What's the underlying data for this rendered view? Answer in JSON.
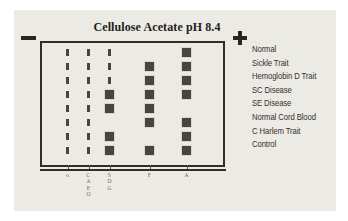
{
  "figure": {
    "title": "Cellulose Acetate pH 8.4",
    "cathode_marker": "−",
    "anode_marker": "+"
  },
  "chart_data": {
    "type": "heatmap",
    "title": "Cellulose Acetate pH 8.4",
    "xlabel": "",
    "ylabel": "",
    "categories": [
      "origin",
      "C\nA2\nE\nO",
      "S\nD\nG",
      "F",
      "A"
    ],
    "column_labels": [
      {
        "id": "origin",
        "lines": [
          "o"
        ]
      },
      {
        "id": "ca2eo",
        "lines": [
          "C",
          "A",
          "E",
          "O"
        ]
      },
      {
        "id": "sdg",
        "lines": [
          "S",
          "D",
          "G"
        ]
      },
      {
        "id": "f",
        "lines": [
          "F"
        ]
      },
      {
        "id": "a",
        "lines": [
          "A"
        ]
      }
    ],
    "rows": [
      {
        "label": "Normal",
        "bands": [
          "tick",
          "tick",
          "tick",
          "none",
          "band"
        ]
      },
      {
        "label": "Sickle Trait",
        "bands": [
          "tick",
          "tick",
          "tick",
          "band",
          "band"
        ]
      },
      {
        "label": "Hemoglobin D Trait",
        "bands": [
          "tick",
          "tick",
          "tick",
          "band",
          "band"
        ]
      },
      {
        "label": "SC Disease",
        "bands": [
          "tick",
          "tick",
          "band",
          "band",
          "band"
        ]
      },
      {
        "label": "SE Disease",
        "bands": [
          "tick",
          "tick",
          "band",
          "band",
          "none"
        ]
      },
      {
        "label": "Normal Cord Blood",
        "bands": [
          "tick",
          "tick",
          "none",
          "band",
          "band"
        ]
      },
      {
        "label": "C Harlem Trait",
        "bands": [
          "tick",
          "tick",
          "band",
          "none",
          "band"
        ]
      },
      {
        "label": "Control",
        "bands": [
          "tick",
          "tick",
          "band",
          "band",
          "band"
        ]
      }
    ],
    "legend": [
      "Normal",
      "Sickle Trait",
      "Hemoglobin D Trait",
      "SC Disease",
      "SE Disease",
      "Normal Cord Blood",
      "C Harlem Trait",
      "Control"
    ],
    "grid": false,
    "legend_position": "right"
  }
}
